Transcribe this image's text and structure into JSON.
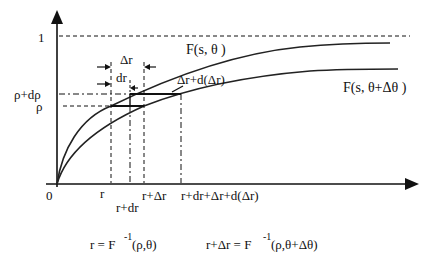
{
  "diagram": {
    "y_axis": {
      "tick_label_one": "1",
      "origin_label": "0"
    },
    "y_labels": {
      "rho_plus_drho": "ρ+dρ",
      "rho": "ρ"
    },
    "x_labels": {
      "r": "r",
      "r_plus_dr": "r+dr",
      "r_plus_delta_r": "r+Δr",
      "r_far": "r+dr+Δr+d(Δr)"
    },
    "curves": {
      "upper": "F(s,  θ )",
      "lower": "F(s,  θ+Δθ )"
    },
    "annotations": {
      "delta_r": "Δr",
      "dr": "dr",
      "delta_r_plus_d": "Δr+d(Δr)"
    },
    "equations": {
      "left_lhs": "r = F",
      "left_sup": "-1",
      "left_rhs": "(ρ,θ)",
      "right_lhs": "r+Δr = F",
      "right_sup": "-1",
      "right_rhs": "(ρ,θ+Δθ)"
    }
  }
}
